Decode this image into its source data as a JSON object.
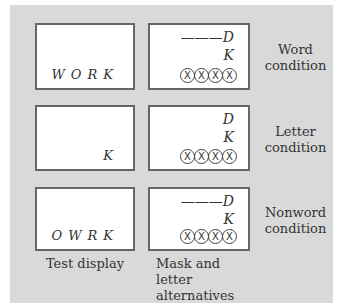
{
  "rows": [
    {
      "test_display": "WORK",
      "alternatives": {
        "top": "———D",
        "middle": "K"
      },
      "mask": [
        "X",
        "X",
        "X",
        "X"
      ],
      "condition": [
        "Word",
        "condition"
      ]
    },
    {
      "test_display": "K",
      "alternatives": {
        "top": "D",
        "middle": "K"
      },
      "mask": [
        "X",
        "X",
        "X",
        "X"
      ],
      "condition": [
        "Letter",
        "condition"
      ]
    },
    {
      "test_display": "OWRK",
      "alternatives": {
        "top": "———D",
        "middle": "K"
      },
      "mask": [
        "X",
        "X",
        "X",
        "X"
      ],
      "condition": [
        "Nonword",
        "condition"
      ]
    }
  ],
  "captions": {
    "left": "Test display",
    "right_line1": "Mask and letter",
    "right_line2": "alternatives"
  }
}
